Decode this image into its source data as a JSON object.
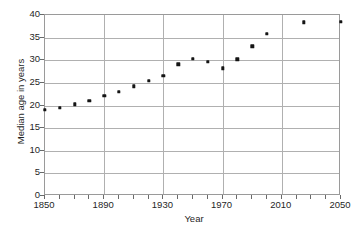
{
  "chart_data": {
    "type": "scatter",
    "title": "",
    "xlabel": "Year",
    "ylabel": "Median age in years",
    "xlim": [
      1850,
      2050
    ],
    "ylim": [
      0,
      40
    ],
    "grid": true,
    "legend": "none",
    "x_tick_labels": [
      "1850",
      "1890",
      "1930",
      "1970",
      "2010",
      "2050"
    ],
    "x_tick_values": [
      1850,
      1890,
      1930,
      1970,
      2010,
      2050
    ],
    "x_minor_tick_step": 10,
    "y_tick_labels": [
      "0",
      "5",
      "10",
      "15",
      "20",
      "25",
      "30",
      "35",
      "40"
    ],
    "y_tick_values": [
      0,
      5,
      10,
      15,
      20,
      25,
      30,
      35,
      40
    ],
    "marker": "square",
    "marker_color": "#141414",
    "x": [
      1850,
      1860,
      1870,
      1880,
      1890,
      1900,
      1910,
      1920,
      1930,
      1940,
      1950,
      1960,
      1970,
      1980,
      1990,
      2000,
      2025,
      2050
    ],
    "values": [
      19.0,
      19.5,
      20.3,
      21.0,
      22.1,
      23.0,
      24.2,
      25.4,
      26.5,
      29.1,
      30.3,
      29.7,
      28.2,
      30.2,
      33.1,
      35.8,
      38.4,
      38.5
    ],
    "points": [
      {
        "year": 1850,
        "age": 19.0
      },
      {
        "year": 1860,
        "age": 19.5
      },
      {
        "year": 1870,
        "age": 20.3
      },
      {
        "year": 1880,
        "age": 21.0
      },
      {
        "year": 1890,
        "age": 22.1
      },
      {
        "year": 1900,
        "age": 23.0
      },
      {
        "year": 1910,
        "age": 24.2
      },
      {
        "year": 1920,
        "age": 25.4
      },
      {
        "year": 1930,
        "age": 26.5
      },
      {
        "year": 1940,
        "age": 29.1
      },
      {
        "year": 1950,
        "age": 30.3
      },
      {
        "year": 1960,
        "age": 29.7
      },
      {
        "year": 1970,
        "age": 28.2
      },
      {
        "year": 1980,
        "age": 30.2
      },
      {
        "year": 1990,
        "age": 33.1
      },
      {
        "year": 2000,
        "age": 35.8
      },
      {
        "year": 2025,
        "age": 38.4
      },
      {
        "year": 2050,
        "age": 38.5
      }
    ]
  },
  "colors": {
    "background": "#ffffff",
    "grid": "#b0b0b0",
    "frame": "#9a9a9a",
    "marker": "#141414",
    "text": "#1f1f1f"
  }
}
